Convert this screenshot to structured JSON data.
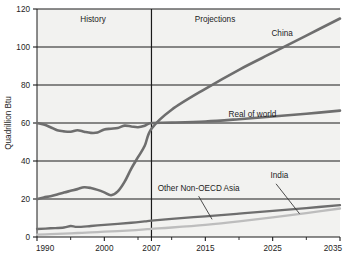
{
  "chart_data": {
    "type": "line",
    "title": "",
    "xlabel": "",
    "ylabel": "Quadrillion Btu",
    "xlim": [
      1990,
      2035
    ],
    "ylim": [
      0,
      120
    ],
    "grid": true,
    "grid_orientation": "horizontal",
    "legend_position": "inline-labels",
    "xticks": [
      "1990",
      "2000",
      "2007",
      "2015",
      "2025",
      "2035"
    ],
    "xtick_values": [
      1990,
      2000,
      2007,
      2015,
      2025,
      2035
    ],
    "yticks": [
      "0",
      "20",
      "40",
      "60",
      "80",
      "100",
      "120"
    ],
    "ytick_values": [
      0,
      20,
      40,
      60,
      80,
      100,
      120
    ],
    "minor_xtick_values": [
      1995,
      2005,
      2010,
      2020,
      2030
    ],
    "divider_year": 2007,
    "regions": [
      {
        "name": "history-region",
        "label": "History",
        "start": 1990,
        "end": 2007
      },
      {
        "name": "projections-region",
        "label": "Projections",
        "start": 2007,
        "end": 2035
      }
    ],
    "series": [
      {
        "name": "China",
        "label": "China",
        "color": "#6e6e6e",
        "width": 2.6,
        "x": [
          1990,
          1991,
          1992,
          1993,
          1994,
          1995,
          1996,
          1997,
          1998,
          1999,
          2000,
          2001,
          2002,
          2003,
          2004,
          2005,
          2006,
          2007,
          2010,
          2015,
          2020,
          2025,
          2030,
          2035
        ],
        "values": [
          20.0,
          20.8,
          21.5,
          22.4,
          23.4,
          24.3,
          25.2,
          26.2,
          25.8,
          24.8,
          23.5,
          22.0,
          24.0,
          29.0,
          36.0,
          42.0,
          48.0,
          57.0,
          67.0,
          78.0,
          88.0,
          97.0,
          106.0,
          115.0
        ]
      },
      {
        "name": "rest-of-world",
        "label": "Real of world",
        "color": "#6e6e6e",
        "width": 2.6,
        "x": [
          1990,
          1991,
          1992,
          1993,
          1994,
          1995,
          1996,
          1997,
          1998,
          1999,
          2000,
          2001,
          2002,
          2003,
          2004,
          2005,
          2006,
          2007,
          2010,
          2015,
          2020,
          2025,
          2030,
          2035
        ],
        "values": [
          60.0,
          59.2,
          57.8,
          56.2,
          55.6,
          55.4,
          56.2,
          55.4,
          54.8,
          55.0,
          56.6,
          57.0,
          57.4,
          58.6,
          58.2,
          57.8,
          58.6,
          60.0,
          60.2,
          60.8,
          62.0,
          63.4,
          64.9,
          66.5
        ]
      },
      {
        "name": "other-non-oecd-asia",
        "label": "Other Non-OECD Asia",
        "color": "#6e6e6e",
        "width": 2.3,
        "x": [
          1990,
          1992,
          1994,
          1995,
          1996,
          1998,
          2000,
          2002,
          2004,
          2006,
          2007,
          2010,
          2015,
          2020,
          2025,
          2030,
          2035
        ],
        "values": [
          4.2,
          4.6,
          5.0,
          5.8,
          5.3,
          5.8,
          6.4,
          6.9,
          7.5,
          8.2,
          8.6,
          9.5,
          10.9,
          12.3,
          13.7,
          15.2,
          16.8
        ]
      },
      {
        "name": "india",
        "label": "India",
        "color": "#bdbdbd",
        "width": 2.3,
        "x": [
          1990,
          1992,
          1994,
          1996,
          1998,
          2000,
          2002,
          2004,
          2006,
          2007,
          2010,
          2015,
          2020,
          2025,
          2030,
          2035
        ],
        "values": [
          1.2,
          1.5,
          1.8,
          2.1,
          2.4,
          2.8,
          3.1,
          3.5,
          4.0,
          4.3,
          5.0,
          6.4,
          8.2,
          10.3,
          12.6,
          15.0
        ]
      }
    ],
    "annotations": [
      {
        "name": "china-label",
        "text": "China",
        "year": 2028,
        "value": 106,
        "anchor": "end"
      },
      {
        "name": "rest-of-world-label",
        "text": "Real of world",
        "year": 2022,
        "value": 63,
        "anchor": "middle"
      },
      {
        "name": "other-non-oecd-asia-label",
        "text": "Other Non-OECD Asia",
        "year": 2014,
        "value": 24,
        "anchor": "middle"
      },
      {
        "name": "india-label",
        "text": "India",
        "year": 2026,
        "value": 31,
        "anchor": "middle"
      }
    ],
    "leader_lines": [
      {
        "name": "other-non-oecd-asia-leader",
        "x1": 2014.0,
        "y1": 21.5,
        "x2": 2016.0,
        "y2": 9.3
      },
      {
        "name": "india-leader",
        "x1": 2025.5,
        "y1": 28.0,
        "x2": 2029.0,
        "y2": 12.2
      }
    ],
    "colors": {
      "plot_background": "#f2f2f0",
      "grid_line": "#1a1a1a",
      "axis_line": "#1a1a1a",
      "divider_line": "#1a1a1a",
      "page_background": "#ffffff",
      "text": "#1d1d1d",
      "dark_series": "#6e6e6e",
      "light_series": "#bdbdbd"
    }
  }
}
